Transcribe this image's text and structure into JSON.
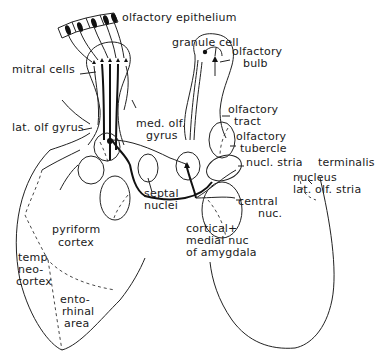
{
  "diagram": {
    "labels": {
      "olfactory_epithelium": "olfactory epithelium",
      "granule_cell": "granule cell",
      "olfactory_bulb_1": "olfactory",
      "olfactory_bulb_2": "bulb",
      "mitral_cells": "mitral cells",
      "olfactory_tract_1": "olfactory",
      "olfactory_tract_2": "tract",
      "lat_olf_gyrus": "lat. olf gyrus",
      "med_olf_gyrus_1": "med. olf.",
      "med_olf_gyrus_2": "gyrus",
      "olfactory_tubercle_1": "olfactory",
      "olfactory_tubercle_2": "tubercle",
      "nucl_stria_terminalis_1": "nucl. stria",
      "nucl_stria_terminalis_2": "terminalis",
      "septal_nuclei_1": "septal",
      "septal_nuclei_2": "nuclei",
      "nucleus_lat_olf_stria_1": "nucleus",
      "nucleus_lat_olf_stria_2": "lat. olf. stria",
      "central_nuc_1": "central",
      "central_nuc_2": "nuc.",
      "pyriform_cortex_1": "pyriform",
      "pyriform_cortex_2": "cortex",
      "cortical_medial_1": "cortical+",
      "cortical_medial_2": "medial nuc",
      "cortical_medial_3": "of amygdala",
      "temp_neocortex_1": "temp",
      "temp_neocortex_2": "neo-",
      "temp_neocortex_3": "cortex",
      "entorhinal_1": "ento-",
      "entorhinal_2": "rhinal",
      "entorhinal_3": "area"
    },
    "colors": {
      "background": "#ffffff",
      "ink": "#1a1a1a"
    }
  }
}
